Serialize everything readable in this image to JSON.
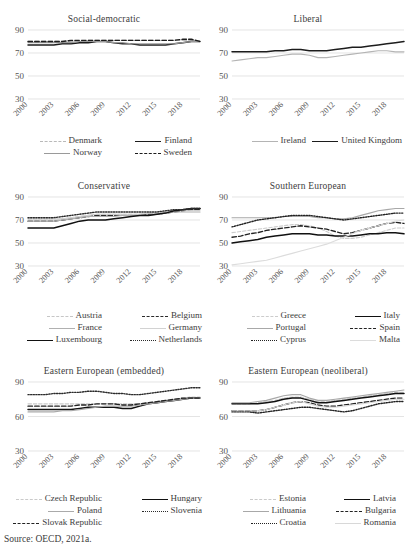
{
  "figure": {
    "source_note": "Source: OECD, 2021a."
  },
  "axis": {
    "x_ticks": [
      "2000",
      "2003",
      "2006",
      "2009",
      "2012",
      "2015",
      "2018"
    ],
    "y_ticks_main": [
      "90",
      "70",
      "50",
      "30"
    ],
    "y_ticks_eastern": [
      "90",
      "60",
      "30"
    ]
  },
  "chart_data": [
    {
      "type": "line",
      "title": "Social-democratic",
      "xlabel": "",
      "ylabel": "",
      "x": [
        2000,
        2001,
        2002,
        2003,
        2004,
        2005,
        2006,
        2007,
        2008,
        2009,
        2010,
        2011,
        2012,
        2013,
        2014,
        2015,
        2016,
        2017,
        2018,
        2019,
        2020
      ],
      "xlim": [
        2000,
        2020
      ],
      "ylim": [
        30,
        90
      ],
      "yticks": [
        30,
        50,
        70,
        90
      ],
      "grid": true,
      "legend_position": "bottom",
      "series": [
        {
          "name": "Denmark",
          "style": "dashed",
          "color": "#b9b9b9",
          "values": [
            80,
            80,
            80,
            80,
            80,
            80,
            80,
            81,
            81,
            81,
            81,
            81,
            81,
            81,
            81,
            81,
            81,
            81,
            81,
            81,
            80
          ]
        },
        {
          "name": "Finland",
          "style": "solid",
          "color": "#1c1c1c",
          "values": [
            77,
            77,
            77,
            77,
            78,
            78,
            79,
            79,
            80,
            80,
            79,
            78,
            78,
            77,
            77,
            77,
            77,
            78,
            79,
            80,
            80
          ]
        },
        {
          "name": "Norway",
          "style": "solid",
          "color": "#9a9a9a",
          "values": [
            79,
            79,
            79,
            79,
            79,
            79,
            80,
            80,
            80,
            80,
            79,
            79,
            78,
            78,
            78,
            78,
            78,
            78,
            79,
            80,
            80
          ]
        },
        {
          "name": "Sweden",
          "style": "dashed",
          "color": "#1c1c1c",
          "values": [
            80,
            80,
            80,
            80,
            80,
            81,
            81,
            81,
            81,
            81,
            81,
            81,
            81,
            81,
            81,
            81,
            81,
            81,
            82,
            82,
            80
          ]
        }
      ]
    },
    {
      "type": "line",
      "title": "Liberal",
      "xlabel": "",
      "ylabel": "",
      "x": [
        2000,
        2001,
        2002,
        2003,
        2004,
        2005,
        2006,
        2007,
        2008,
        2009,
        2010,
        2011,
        2012,
        2013,
        2014,
        2015,
        2016,
        2017,
        2018,
        2019,
        2020
      ],
      "xlim": [
        2000,
        2020
      ],
      "ylim": [
        30,
        90
      ],
      "yticks": [
        30,
        50,
        70,
        90
      ],
      "grid": true,
      "legend_position": "bottom",
      "series": [
        {
          "name": "Ireland",
          "style": "solid",
          "color": "#b4b4b4",
          "values": [
            63,
            64,
            65,
            66,
            66,
            67,
            68,
            69,
            69,
            68,
            66,
            66,
            67,
            68,
            69,
            70,
            71,
            72,
            72,
            71,
            71
          ]
        },
        {
          "name": "United Kingdom",
          "style": "solid",
          "color": "#1c1c1c",
          "values": [
            71,
            71,
            71,
            71,
            71,
            72,
            72,
            73,
            73,
            72,
            72,
            72,
            73,
            74,
            75,
            75,
            76,
            77,
            78,
            79,
            80
          ]
        }
      ]
    },
    {
      "type": "line",
      "title": "Conservative",
      "xlabel": "",
      "ylabel": "",
      "x": [
        2000,
        2001,
        2002,
        2003,
        2004,
        2005,
        2006,
        2007,
        2008,
        2009,
        2010,
        2011,
        2012,
        2013,
        2014,
        2015,
        2016,
        2017,
        2018,
        2019,
        2020
      ],
      "xlim": [
        2000,
        2020
      ],
      "ylim": [
        30,
        90
      ],
      "yticks": [
        30,
        50,
        70,
        90
      ],
      "grid": true,
      "legend_position": "bottom",
      "series": [
        {
          "name": "Austria",
          "style": "dashdot",
          "color": "#c6c6c6",
          "values": [
            71,
            71,
            71,
            71,
            71,
            72,
            73,
            74,
            75,
            75,
            75,
            75,
            75,
            75,
            76,
            76,
            77,
            78,
            79,
            79,
            79
          ]
        },
        {
          "name": "Belgium",
          "style": "dashed",
          "color": "#2b2b2b",
          "values": [
            69,
            69,
            69,
            69,
            70,
            71,
            72,
            73,
            74,
            74,
            74,
            74,
            74,
            74,
            75,
            75,
            76,
            77,
            78,
            79,
            79
          ]
        },
        {
          "name": "France",
          "style": "solid",
          "color": "#b0b0b0",
          "values": [
            69,
            69,
            69,
            69,
            70,
            71,
            72,
            73,
            73,
            73,
            73,
            74,
            74,
            74,
            74,
            75,
            76,
            77,
            77,
            77,
            77
          ]
        },
        {
          "name": "Germany",
          "style": "solid",
          "color": "#d2d2d2",
          "values": [
            71,
            71,
            71,
            71,
            71,
            72,
            73,
            74,
            75,
            75,
            75,
            75,
            75,
            75,
            76,
            76,
            77,
            78,
            78,
            78,
            78
          ]
        },
        {
          "name": "Luxembourg",
          "style": "solid",
          "color": "#111111",
          "values": [
            63,
            63,
            63,
            63,
            65,
            67,
            69,
            70,
            70,
            70,
            71,
            72,
            73,
            74,
            74,
            75,
            76,
            78,
            79,
            80,
            80
          ]
        },
        {
          "name": "Netherlands",
          "style": "dotted",
          "color": "#2b2b2b",
          "values": [
            72,
            72,
            72,
            72,
            73,
            74,
            75,
            76,
            77,
            77,
            77,
            77,
            77,
            77,
            77,
            77,
            78,
            79,
            79,
            80,
            80
          ]
        }
      ]
    },
    {
      "type": "line",
      "title": "Southern European",
      "xlabel": "",
      "ylabel": "",
      "x": [
        2000,
        2001,
        2002,
        2003,
        2004,
        2005,
        2006,
        2007,
        2008,
        2009,
        2010,
        2011,
        2012,
        2013,
        2014,
        2015,
        2016,
        2017,
        2018,
        2019,
        2020
      ],
      "xlim": [
        2000,
        2020
      ],
      "ylim": [
        30,
        90
      ],
      "yticks": [
        30,
        50,
        70,
        90
      ],
      "grid": true,
      "legend_position": "bottom",
      "series": [
        {
          "name": "Greece",
          "style": "dashdot",
          "color": "#cccccc",
          "values": [
            59,
            60,
            61,
            62,
            63,
            64,
            65,
            66,
            66,
            65,
            63,
            60,
            56,
            54,
            54,
            55,
            57,
            59,
            61,
            63,
            63
          ]
        },
        {
          "name": "Italy",
          "style": "solid",
          "color": "#111111",
          "values": [
            50,
            51,
            52,
            53,
            55,
            56,
            57,
            58,
            58,
            58,
            57,
            57,
            56,
            56,
            56,
            57,
            58,
            58,
            59,
            59,
            58
          ]
        },
        {
          "name": "Portugal",
          "style": "solid",
          "color": "#a8a8a8",
          "values": [
            72,
            72,
            72,
            72,
            72,
            72,
            73,
            73,
            73,
            73,
            72,
            72,
            71,
            71,
            72,
            74,
            76,
            78,
            79,
            80,
            80
          ]
        },
        {
          "name": "Spain",
          "style": "dashed",
          "color": "#222222",
          "values": [
            55,
            56,
            58,
            59,
            61,
            62,
            63,
            64,
            65,
            64,
            63,
            62,
            60,
            58,
            59,
            61,
            63,
            65,
            67,
            68,
            67
          ]
        },
        {
          "name": "Cyprus",
          "style": "dotted",
          "color": "#222222",
          "values": [
            64,
            66,
            68,
            70,
            71,
            72,
            73,
            74,
            74,
            74,
            73,
            72,
            71,
            70,
            71,
            72,
            73,
            74,
            75,
            76,
            76
          ]
        },
        {
          "name": "Malta",
          "style": "solid",
          "color": "#dcdcdc",
          "values": [
            31,
            32,
            33,
            34,
            35,
            37,
            39,
            41,
            43,
            45,
            47,
            49,
            52,
            55,
            58,
            61,
            63,
            65,
            67,
            69,
            70
          ]
        }
      ]
    },
    {
      "type": "line",
      "title": "Eastern European (embedded)",
      "xlabel": "",
      "ylabel": "",
      "x": [
        2000,
        2001,
        2002,
        2003,
        2004,
        2005,
        2006,
        2007,
        2008,
        2009,
        2010,
        2011,
        2012,
        2013,
        2014,
        2015,
        2016,
        2017,
        2018,
        2019,
        2020
      ],
      "xlim": [
        2000,
        2020
      ],
      "ylim": [
        30,
        90
      ],
      "yticks": [
        30,
        60,
        90
      ],
      "grid": true,
      "legend_position": "bottom",
      "series": [
        {
          "name": "Czech Republic",
          "style": "dashdot",
          "color": "#cacaca",
          "values": [
            71,
            71,
            71,
            71,
            71,
            71,
            71,
            71,
            71,
            71,
            71,
            71,
            71,
            71,
            72,
            73,
            74,
            75,
            76,
            77,
            77
          ]
        },
        {
          "name": "Hungary",
          "style": "solid",
          "color": "#111111",
          "values": [
            66,
            66,
            66,
            66,
            66,
            66,
            67,
            68,
            68,
            68,
            68,
            67,
            67,
            69,
            71,
            72,
            73,
            74,
            75,
            76,
            76
          ]
        },
        {
          "name": "Poland",
          "style": "solid",
          "color": "#aaaaaa",
          "values": [
            64,
            64,
            64,
            64,
            65,
            65,
            66,
            67,
            68,
            69,
            69,
            69,
            69,
            70,
            71,
            72,
            73,
            74,
            75,
            76,
            76
          ]
        },
        {
          "name": "Slovenia",
          "style": "dotted",
          "color": "#2b2b2b",
          "values": [
            79,
            79,
            79,
            80,
            80,
            81,
            81,
            82,
            82,
            81,
            80,
            80,
            79,
            79,
            80,
            81,
            82,
            83,
            84,
            85,
            85
          ]
        },
        {
          "name": "Slovak Republic",
          "style": "dashed",
          "color": "#222222",
          "values": [
            69,
            69,
            69,
            69,
            69,
            69,
            70,
            70,
            71,
            71,
            71,
            70,
            70,
            71,
            72,
            73,
            74,
            75,
            76,
            76,
            76
          ]
        }
      ]
    },
    {
      "type": "line",
      "title": "Eastern European (neoliberal)",
      "xlabel": "",
      "ylabel": "",
      "x": [
        2000,
        2001,
        2002,
        2003,
        2004,
        2005,
        2006,
        2007,
        2008,
        2009,
        2010,
        2011,
        2012,
        2013,
        2014,
        2015,
        2016,
        2017,
        2018,
        2019,
        2020
      ],
      "xlim": [
        2000,
        2020
      ],
      "ylim": [
        30,
        90
      ],
      "yticks": [
        30,
        60,
        90
      ],
      "grid": true,
      "legend_position": "bottom",
      "series": [
        {
          "name": "Estonia",
          "style": "dashdot",
          "color": "#cacaca",
          "values": [
            71,
            71,
            71,
            72,
            73,
            74,
            76,
            77,
            77,
            75,
            73,
            73,
            74,
            75,
            76,
            77,
            78,
            79,
            80,
            81,
            81
          ]
        },
        {
          "name": "Latvia",
          "style": "solid",
          "color": "#111111",
          "values": [
            71,
            71,
            71,
            71,
            72,
            73,
            75,
            76,
            76,
            74,
            72,
            72,
            73,
            74,
            75,
            76,
            77,
            78,
            79,
            80,
            80
          ]
        },
        {
          "name": "Lithuania",
          "style": "solid",
          "color": "#a8a8a8",
          "values": [
            72,
            72,
            72,
            73,
            74,
            76,
            78,
            79,
            79,
            76,
            74,
            74,
            75,
            76,
            77,
            78,
            79,
            80,
            81,
            82,
            83
          ]
        },
        {
          "name": "Bulgaria",
          "style": "dashed",
          "color": "#222222",
          "values": [
            65,
            65,
            65,
            65,
            66,
            68,
            70,
            72,
            73,
            72,
            70,
            69,
            69,
            70,
            71,
            72,
            73,
            74,
            75,
            76,
            76
          ]
        },
        {
          "name": "Croatia",
          "style": "dotted",
          "color": "#222222",
          "values": [
            64,
            64,
            64,
            63,
            64,
            65,
            66,
            67,
            68,
            68,
            67,
            66,
            65,
            64,
            65,
            67,
            69,
            71,
            72,
            73,
            73
          ]
        },
        {
          "name": "Romania",
          "style": "solid",
          "color": "#d8d8d8",
          "values": [
            65,
            65,
            65,
            65,
            66,
            68,
            70,
            72,
            73,
            71,
            69,
            68,
            68,
            69,
            70,
            71,
            72,
            73,
            74,
            75,
            75
          ]
        }
      ]
    }
  ]
}
